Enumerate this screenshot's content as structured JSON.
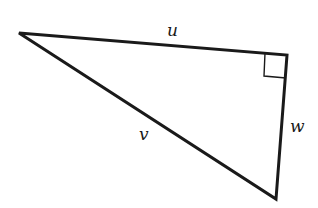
{
  "diagram": {
    "type": "right-triangle",
    "vertices": {
      "left": [
        19,
        33
      ],
      "right_angle": [
        287,
        55
      ],
      "bottom": [
        276,
        199
      ]
    },
    "right_angle_marker": {
      "corner": [
        287,
        55
      ],
      "size": 23
    },
    "stroke_color": "#1a1a1a",
    "labels": {
      "u": "u",
      "v": "v",
      "w": "w"
    },
    "sides": [
      {
        "label": "u",
        "from": "left",
        "to": "right_angle"
      },
      {
        "label": "v",
        "from": "left",
        "to": "bottom"
      },
      {
        "label": "w",
        "from": "right_angle",
        "to": "bottom"
      }
    ]
  }
}
